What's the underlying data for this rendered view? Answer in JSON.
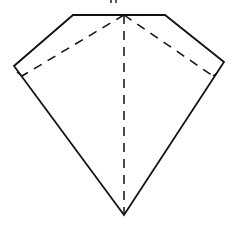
{
  "diagram": {
    "colors": {
      "stroke": "#111111",
      "background": "#ffffff"
    },
    "outline": {
      "points": [
        [
          73,
          15
        ],
        [
          165,
          15
        ],
        [
          224,
          62
        ],
        [
          124,
          215
        ],
        [
          14,
          66
        ]
      ],
      "style": "solid"
    },
    "top_label_fragment": {
      "x": 113,
      "y": 2,
      "note": "cropped text mark above top edge"
    },
    "fold_lines": [
      {
        "name": "center",
        "from": [
          124,
          15
        ],
        "to": [
          124,
          213
        ],
        "style": "dashed"
      },
      {
        "name": "left",
        "from": [
          124,
          15
        ],
        "to": [
          22,
          76
        ],
        "style": "dashed"
      },
      {
        "name": "right",
        "from": [
          124,
          15
        ],
        "to": [
          213,
          76
        ],
        "style": "dashed"
      },
      {
        "name": "left-tick",
        "from": [
          22,
          76
        ],
        "to": [
          17,
          72
        ],
        "style": "solid"
      },
      {
        "name": "right-tick",
        "from": [
          213,
          76
        ],
        "to": [
          217,
          73
        ],
        "style": "solid"
      }
    ]
  }
}
